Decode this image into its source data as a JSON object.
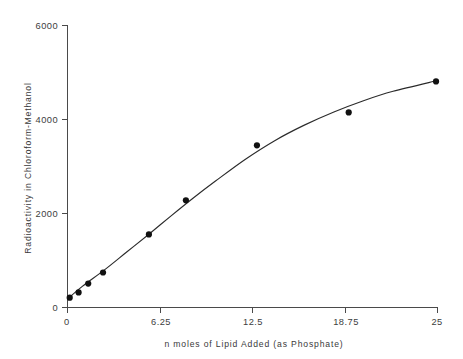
{
  "chart_data": {
    "type": "scatter",
    "title": "",
    "xlabel": "n moles of Lipid Added  (as Phosphate)",
    "ylabel": "Radioactivity  in  Chloroform-Methanol",
    "xlim": [
      0,
      25
    ],
    "ylim": [
      0,
      6000
    ],
    "grid": false,
    "legend": "none",
    "xticks": [
      0,
      6.25,
      12.5,
      18.75,
      25
    ],
    "xtick_labels": [
      "0",
      "6.25",
      "12.5",
      "18.75",
      "25"
    ],
    "yticks": [
      0,
      2000,
      4000,
      6000
    ],
    "ytick_labels": [
      "0",
      "2000",
      "4000",
      "6000"
    ],
    "series": [
      {
        "name": "Radioactivity",
        "marker": "filled-circle",
        "has_fitted_curve": true,
        "x": [
          0.15,
          0.75,
          1.4,
          2.4,
          5.5,
          8.0,
          12.8,
          19.0,
          24.9
        ],
        "y": [
          210,
          320,
          510,
          745,
          1555,
          2280,
          3450,
          4150,
          4810
        ]
      }
    ],
    "fitted_curve": {
      "description": "smooth saturating curve through data",
      "x": [
        0.0,
        1.0,
        2.5,
        4.0,
        5.5,
        7.0,
        8.5,
        10.0,
        12.0,
        14.0,
        16.0,
        18.0,
        20.0,
        22.0,
        25.0
      ],
      "y": [
        180,
        450,
        800,
        1180,
        1560,
        1950,
        2330,
        2690,
        3150,
        3550,
        3880,
        4160,
        4400,
        4600,
        4830
      ]
    }
  },
  "style": {
    "axis_color": "#4a4a4a",
    "curve_color": "#2b2b2b",
    "marker_color": "#111111",
    "text_color": "#3d3d3d",
    "background": "#ffffff"
  }
}
